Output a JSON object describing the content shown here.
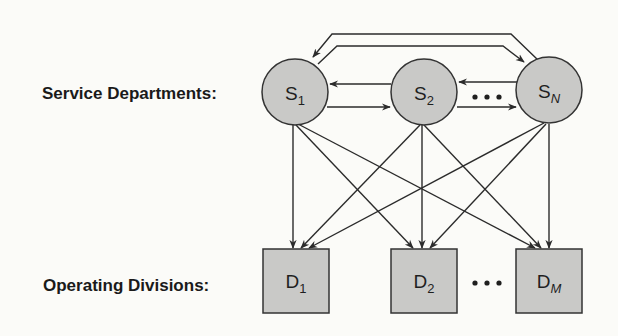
{
  "labels": {
    "service": "Service Departments:",
    "operating": "Operating Divisions:"
  },
  "service_departments": [
    {
      "id": "S1",
      "main": "S",
      "sub": "1",
      "sub_italic": false
    },
    {
      "id": "S2",
      "main": "S",
      "sub": "2",
      "sub_italic": false
    },
    {
      "id": "SN",
      "main": "S",
      "sub": "N",
      "sub_italic": true
    }
  ],
  "operating_divisions": [
    {
      "id": "D1",
      "main": "D",
      "sub": "1",
      "sub_italic": false
    },
    {
      "id": "D2",
      "main": "D",
      "sub": "2",
      "sub_italic": false
    },
    {
      "id": "DM",
      "main": "D",
      "sub": "M",
      "sub_italic": true
    }
  ],
  "ellipsis": "•••",
  "colors": {
    "node_fill": "#c9c9c7",
    "stroke": "#2b2b2b",
    "background": "#fbfbf8"
  },
  "edges": [
    {
      "from": "S1",
      "to": "S2"
    },
    {
      "from": "S2",
      "to": "S1"
    },
    {
      "from": "S2",
      "to": "SN"
    },
    {
      "from": "SN",
      "to": "S2"
    },
    {
      "from": "S1",
      "to": "SN"
    },
    {
      "from": "SN",
      "to": "S1"
    },
    {
      "from": "S1",
      "to": "D1"
    },
    {
      "from": "S1",
      "to": "D2"
    },
    {
      "from": "S1",
      "to": "DM"
    },
    {
      "from": "S2",
      "to": "D1"
    },
    {
      "from": "S2",
      "to": "D2"
    },
    {
      "from": "S2",
      "to": "DM"
    },
    {
      "from": "SN",
      "to": "D1"
    },
    {
      "from": "SN",
      "to": "D2"
    },
    {
      "from": "SN",
      "to": "DM"
    }
  ]
}
